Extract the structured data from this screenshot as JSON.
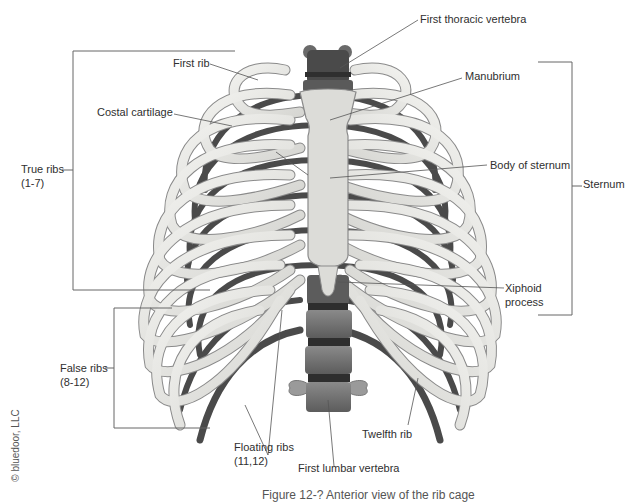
{
  "figure": {
    "caption": "Figure 12-? Anterior view of the rib cage",
    "credit": "© bluedoor, LLC"
  },
  "labels": {
    "first_thoracic_vertebra": "First thoracic vertebra",
    "first_rib": "First rib",
    "manubrium": "Manubrium",
    "costal_cartilage": "Costal cartilage",
    "body_of_sternum": "Body of sternum",
    "sternum": "Sternum",
    "true_ribs": "True ribs",
    "true_ribs_range": "(1-7)",
    "xiphoid_1": "Xiphoid",
    "xiphoid_2": "process",
    "false_ribs": "False ribs",
    "false_ribs_range": "(8-12)",
    "floating_ribs": "Floating ribs",
    "floating_ribs_range": "(11,12)",
    "first_lumbar_vertebra": "First lumbar vertebra",
    "twelfth_rib": "Twelfth rib"
  },
  "colors": {
    "bone": "#e6e6e2",
    "bone_outline": "#8a8a8a",
    "dark_rib": "#4a4a4a",
    "vertebra": "#6e6e6e",
    "vertebra_dark": "#3c3c3c",
    "leader": "#555555"
  }
}
